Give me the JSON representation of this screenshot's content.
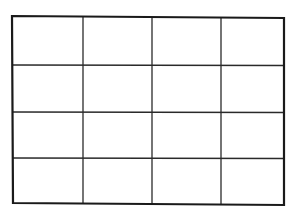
{
  "diagram": {
    "type": "grid",
    "rows": 4,
    "columns": 4,
    "cell_count": 16,
    "line_color": "#1a1a1a",
    "inner_line_color": "#2a2a2a",
    "background_color": "#ffffff",
    "outer_border": {
      "corners": {
        "top_left": [
          12,
          16
        ],
        "top_right": [
          284,
          18
        ],
        "bottom_right": [
          284,
          205
        ],
        "bottom_left": [
          13,
          203
        ]
      },
      "stroke_width": 2.2
    },
    "vertical_lines_x": [
      83,
      152,
      221
    ],
    "horizontal_lines_y": [
      65,
      112,
      158
    ],
    "inner_stroke_width": 1.3
  }
}
